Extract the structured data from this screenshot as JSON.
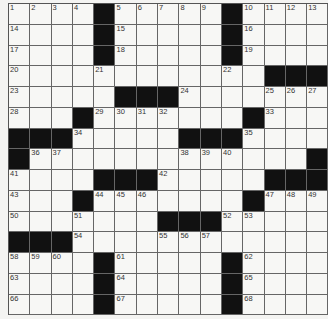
{
  "puzzle": {
    "rows": 15,
    "cols": 15,
    "colors": {
      "block": "#111111",
      "cell": "#f7f7f5",
      "line": "#666666"
    },
    "grid": [
      "1 2 3 4 # 5 6 7 8 9 # 10 11 12 13",
      "14 . . . # 15 . . . . # 16 . . .",
      "17 . . . # 18 . . . . # 19 . . .",
      "20 . . . 21 . . . . . 22 . # # #",
      "23 . . . . # # # 24 . . . 25 26 27",
      "28 . . # 29 30 31 32 . . . # 33 . .",
      "# # # 34 . . . . # # # 35 . . .",
      "# 36 37 . . . . . 38 39 40 . . . #",
      "41 . . . # # # 42 . . . . # # #",
      "43 . . # 44 45 46 . . . . # 47 48 49",
      "50 . . 51 . . . # # # 52 53 . . .",
      "# # # 54 . . . 55 56 57 . . . . .",
      "58 59 60 . # 61 . . . . # 62 . . .",
      "63 . . . # 64 . . . . # 65 . . .",
      "66 . . . # 67 . . . . # 68 . . ."
    ]
  }
}
